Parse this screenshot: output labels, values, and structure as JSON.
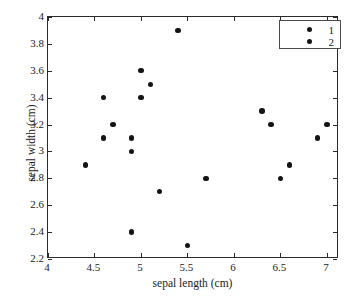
{
  "chart_data": {
    "type": "scatter",
    "title": "",
    "xlabel": "sepal length (cm)",
    "ylabel": "sepal width (cm)",
    "xlim": [
      4,
      7.13
    ],
    "ylim": [
      2.2,
      4
    ],
    "xticks": [
      "4",
      "4.5",
      "5",
      "5.5",
      "6",
      "6.5",
      "7"
    ],
    "xtick_values": [
      4,
      4.5,
      5,
      5.5,
      6,
      6.5,
      7
    ],
    "yticks": [
      "2.2",
      "2.4",
      "2.6",
      "2.8",
      "3",
      "3.2",
      "3.4",
      "3.6",
      "3.8",
      "4"
    ],
    "ytick_values": [
      2.2,
      2.4,
      2.6,
      2.8,
      3,
      3.2,
      3.4,
      3.6,
      3.8,
      4
    ],
    "grid": false,
    "legend_position": "top-right",
    "marker_color": "#141414",
    "series": [
      {
        "name": "1",
        "points": [
          {
            "x": 4.4,
            "y": 2.9
          },
          {
            "x": 4.6,
            "y": 3.4
          },
          {
            "x": 4.6,
            "y": 3.1
          },
          {
            "x": 4.7,
            "y": 3.2
          },
          {
            "x": 4.9,
            "y": 3.1
          },
          {
            "x": 4.9,
            "y": 3.0
          },
          {
            "x": 4.9,
            "y": 2.4
          },
          {
            "x": 5.0,
            "y": 3.6
          },
          {
            "x": 5.0,
            "y": 3.4
          },
          {
            "x": 5.1,
            "y": 3.5
          },
          {
            "x": 5.2,
            "y": 2.7
          },
          {
            "x": 5.4,
            "y": 3.9
          },
          {
            "x": 5.5,
            "y": 2.3
          },
          {
            "x": 5.7,
            "y": 2.8
          }
        ]
      },
      {
        "name": "2",
        "points": [
          {
            "x": 6.3,
            "y": 3.3
          },
          {
            "x": 6.4,
            "y": 3.2
          },
          {
            "x": 6.5,
            "y": 2.8
          },
          {
            "x": 6.6,
            "y": 2.9
          },
          {
            "x": 6.9,
            "y": 3.1
          },
          {
            "x": 7.0,
            "y": 3.2
          }
        ]
      }
    ]
  },
  "legend": {
    "entries": [
      {
        "label": "1"
      },
      {
        "label": "2"
      }
    ]
  }
}
